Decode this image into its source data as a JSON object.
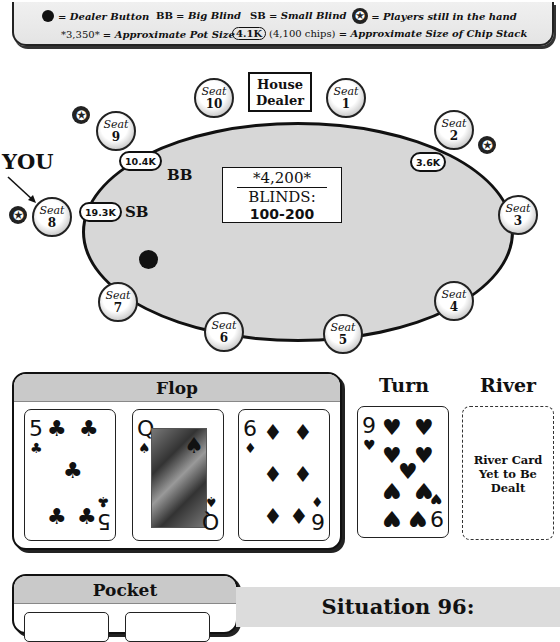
{
  "legend": {
    "dealer_button": "= Dealer Button",
    "bb_abbr": "BB",
    "bb_text": "= Big Blind",
    "sb_abbr": "SB",
    "sb_text": "= Small Blind",
    "star_text": "= Players still in the hand",
    "pot_example": "*3,350*",
    "pot_text": "= Approximate Pot Size",
    "chip_example": "4.1K",
    "chip_example_detail": "(4,100 chips)",
    "chip_text": "= Approximate Size of Chip Stack"
  },
  "table": {
    "house_dealer_line1": "House",
    "house_dealer_line2": "Dealer",
    "pot": "*4,200*",
    "blinds_label": "BLINDS:",
    "blinds_value": "100-200",
    "you_label": "YOU",
    "seat_word": "Seat",
    "seats": [
      {
        "number": "1"
      },
      {
        "number": "2",
        "stack": "3.6K",
        "in_hand": true
      },
      {
        "number": "3"
      },
      {
        "number": "4"
      },
      {
        "number": "5"
      },
      {
        "number": "6"
      },
      {
        "number": "7"
      },
      {
        "number": "8",
        "stack": "19.3K",
        "blind": "SB",
        "in_hand": true,
        "is_you": true
      },
      {
        "number": "9",
        "stack": "10.4K",
        "blind": "BB",
        "in_hand": true
      },
      {
        "number": "10"
      }
    ],
    "dealer_button_seat": "7",
    "star_glyph": "✪"
  },
  "board": {
    "flop_title": "Flop",
    "turn_title": "Turn",
    "river_title": "River",
    "flop": [
      {
        "rank": "5",
        "suit": "♣"
      },
      {
        "rank": "Q",
        "suit": "♠"
      },
      {
        "rank": "6",
        "suit": "♦"
      }
    ],
    "turn": {
      "rank": "9",
      "suit": "♥"
    },
    "river_placeholder": "River Card Yet to Be Dealt"
  },
  "pocket": {
    "title": "Pocket"
  },
  "situation": {
    "title": "Situation 96:"
  }
}
